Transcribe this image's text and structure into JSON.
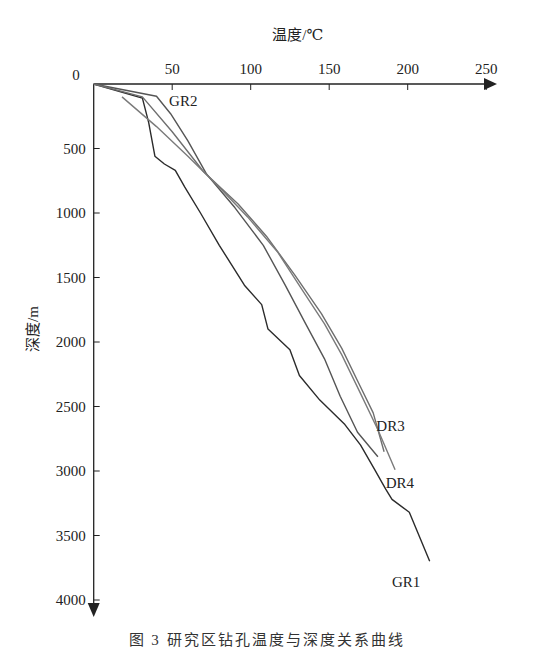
{
  "chart_data": {
    "type": "line",
    "title": "",
    "xlabel": "温度/℃",
    "ylabel": "深度/m",
    "x_axis_position": "top",
    "y_axis_inverted": true,
    "xlim": [
      0,
      260
    ],
    "ylim": [
      0,
      4000
    ],
    "x_ticks": [
      50,
      100,
      150,
      200,
      250
    ],
    "y_ticks": [
      500,
      1000,
      1500,
      2000,
      2500,
      3000,
      3500,
      4000
    ],
    "origin_label": "0",
    "grid": false,
    "legend": "inline labels at curve ends",
    "series": [
      {
        "name": "GR1",
        "color": "#2b2b2b",
        "points": [
          [
            0,
            0
          ],
          [
            31,
            110
          ],
          [
            35,
            300
          ],
          [
            39,
            560
          ],
          [
            45,
            620
          ],
          [
            52,
            670
          ],
          [
            58,
            800
          ],
          [
            68,
            1000
          ],
          [
            80,
            1250
          ],
          [
            96,
            1560
          ],
          [
            107,
            1710
          ],
          [
            111,
            1900
          ],
          [
            125,
            2060
          ],
          [
            131,
            2260
          ],
          [
            144,
            2450
          ],
          [
            160,
            2640
          ],
          [
            170,
            2800
          ],
          [
            179,
            2990
          ],
          [
            186,
            3140
          ],
          [
            190,
            3220
          ],
          [
            201,
            3320
          ],
          [
            214,
            3700
          ]
        ]
      },
      {
        "name": "GR2",
        "color": "#555555",
        "points": [
          [
            0,
            0
          ],
          [
            40,
            95
          ],
          [
            49,
            230
          ],
          [
            60,
            440
          ],
          [
            72,
            700
          ],
          [
            90,
            960
          ],
          [
            108,
            1250
          ],
          [
            122,
            1560
          ],
          [
            135,
            1860
          ],
          [
            147,
            2130
          ],
          [
            157,
            2420
          ],
          [
            168,
            2700
          ],
          [
            181,
            2890
          ]
        ]
      },
      {
        "name": "DR3",
        "color": "#6e6e6e",
        "points": [
          [
            0,
            0
          ],
          [
            31,
            100
          ],
          [
            50,
            370
          ],
          [
            70,
            680
          ],
          [
            92,
            930
          ],
          [
            110,
            1180
          ],
          [
            128,
            1480
          ],
          [
            145,
            1780
          ],
          [
            158,
            2050
          ],
          [
            168,
            2300
          ],
          [
            178,
            2550
          ],
          [
            185,
            2850
          ]
        ]
      },
      {
        "name": "DR4",
        "color": "#7a7a7a",
        "points": [
          [
            18,
            100
          ],
          [
            40,
            330
          ],
          [
            60,
            560
          ],
          [
            80,
            800
          ],
          [
            98,
            1030
          ],
          [
            117,
            1300
          ],
          [
            133,
            1600
          ],
          [
            147,
            1860
          ],
          [
            158,
            2100
          ],
          [
            170,
            2400
          ],
          [
            181,
            2680
          ],
          [
            192,
            2990
          ]
        ]
      }
    ],
    "labels": [
      {
        "text": "GR2",
        "t": 48,
        "d": 130
      },
      {
        "text": "DR3",
        "t": 180,
        "d": 2650
      },
      {
        "text": "DR4",
        "t": 186,
        "d": 3090
      },
      {
        "text": "GR1",
        "t": 190,
        "d": 3860
      }
    ]
  },
  "caption": "图 3  研究区钻孔温度与深度关系曲线"
}
